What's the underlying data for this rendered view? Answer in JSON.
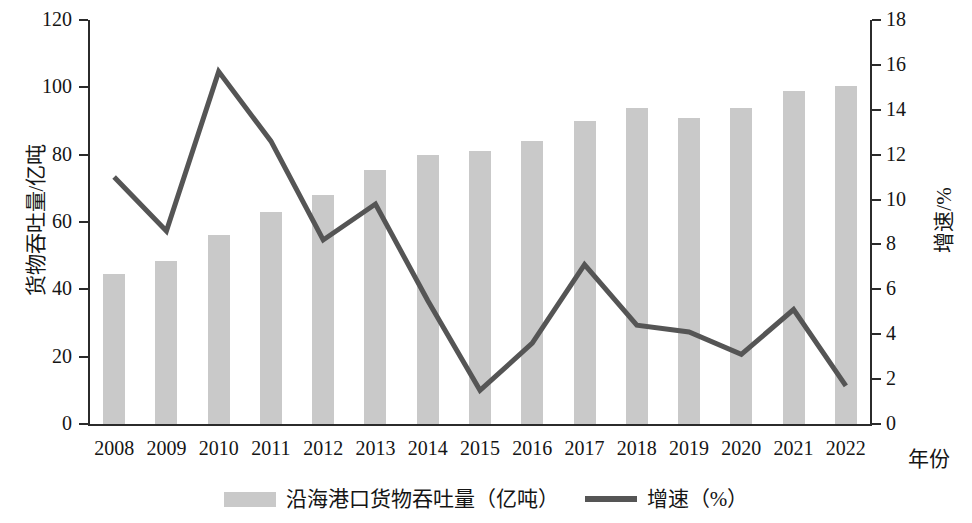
{
  "chart_data": {
    "type": "bar",
    "title": "",
    "subtitle": "",
    "xlabel": "年份",
    "ylabel": "货物吞吐量/亿吨",
    "y2label": "增速/%",
    "categories": [
      "2008",
      "2009",
      "2010",
      "2011",
      "2012",
      "2013",
      "2014",
      "2015",
      "2016",
      "2017",
      "2018",
      "2019",
      "2020",
      "2021",
      "2022"
    ],
    "ylim": [
      0,
      120
    ],
    "y2lim": [
      0,
      18
    ],
    "yticks": [
      0,
      20,
      40,
      60,
      80,
      100,
      120
    ],
    "y2ticks": [
      0,
      2,
      4,
      6,
      8,
      10,
      12,
      14,
      16,
      18
    ],
    "grid": false,
    "legend_position": "bottom-center",
    "series": [
      {
        "name": "沿海港口货物吞吐量（亿吨）",
        "type": "bar",
        "axis": "left",
        "color": "#c9c9c9",
        "values": [
          44.5,
          48.5,
          56.0,
          63.0,
          68.0,
          75.5,
          80.0,
          81.0,
          84.0,
          90.0,
          94.0,
          91.0,
          94.0,
          99.0,
          100.5
        ]
      },
      {
        "name": "增速（%）",
        "type": "line",
        "axis": "right",
        "color": "#555555",
        "values": [
          11.0,
          8.6,
          15.7,
          12.6,
          8.2,
          9.8,
          5.5,
          1.5,
          3.6,
          7.1,
          4.4,
          4.1,
          3.1,
          5.1,
          1.7
        ]
      }
    ]
  },
  "axes": {
    "left": {
      "title": "货物吞吐量/亿吨",
      "tick_labels": [
        "0",
        "20",
        "40",
        "60",
        "80",
        "100",
        "120"
      ]
    },
    "right": {
      "title": "增速/%",
      "tick_labels": [
        "0",
        "2",
        "4",
        "6",
        "8",
        "10",
        "12",
        "14",
        "16",
        "18"
      ]
    },
    "bottom": {
      "title": "年份",
      "tick_labels": [
        "2008",
        "2009",
        "2010",
        "2011",
        "2012",
        "2013",
        "2014",
        "2015",
        "2016",
        "2017",
        "2018",
        "2019",
        "2020",
        "2021",
        "2022"
      ]
    }
  },
  "legend": {
    "items": [
      {
        "label": "沿海港口货物吞吐量（亿吨）",
        "marker": "bar-swatch",
        "color": "#c9c9c9"
      },
      {
        "label": "增速（%）",
        "marker": "line-swatch",
        "color": "#555555"
      }
    ]
  },
  "colors": {
    "bar": "#c9c9c9",
    "line": "#555555",
    "axis": "#2b2b2b",
    "text": "#151515",
    "background": "#ffffff"
  }
}
